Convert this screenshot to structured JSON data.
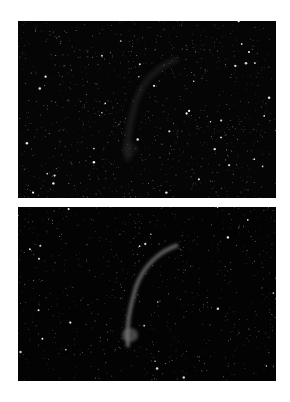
{
  "figure": {
    "panels": [
      {
        "id": "top",
        "subject": "star field with faint nebula arc",
        "nebula_visibility": "faint",
        "background_color": "#050505",
        "nebula_color": "#2a2a2a",
        "star_count": 900,
        "seed": 7
      },
      {
        "id": "bottom",
        "subject": "star field with enhanced nebula arc",
        "nebula_visibility": "enhanced",
        "background_color": "#030303",
        "nebula_color": "#7a7a7a",
        "star_count": 650,
        "seed": 13
      }
    ]
  }
}
